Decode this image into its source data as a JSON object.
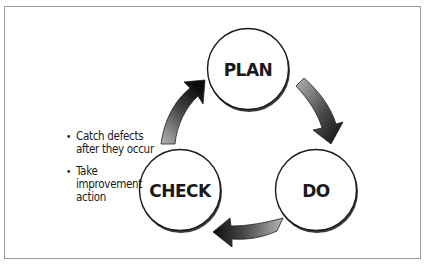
{
  "diagram": {
    "nodes": [
      {
        "id": "plan",
        "label": "PLAN"
      },
      {
        "id": "do",
        "label": "DO"
      },
      {
        "id": "check",
        "label": "CHECK"
      }
    ],
    "edges": [
      {
        "from": "plan",
        "to": "do"
      },
      {
        "from": "do",
        "to": "check"
      },
      {
        "from": "check",
        "to": "plan"
      }
    ],
    "notes": [
      "Catch defects after they occur",
      "Take improvement action"
    ]
  }
}
